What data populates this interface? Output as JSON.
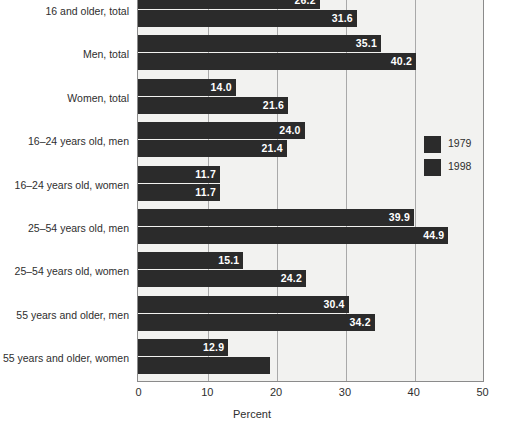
{
  "chart_data": {
    "type": "bar",
    "orientation": "horizontal",
    "title": "",
    "xlabel": "Percent",
    "ylabel": "",
    "xlim": [
      0,
      50
    ],
    "xticks": [
      0,
      10,
      20,
      30,
      40,
      50
    ],
    "grid": true,
    "legend_position": "right",
    "categories": [
      "16 and older, total",
      "Men, total",
      "Women, total",
      "16–24 years old, men",
      "16–24 years old, women",
      "25–54 years old, men",
      "25–54 years old, women",
      "55 years and older, men",
      "55 years and older, women"
    ],
    "series": [
      {
        "name": "1979",
        "values": [
          26.2,
          35.1,
          14.0,
          24.0,
          11.7,
          39.9,
          15.1,
          30.4,
          12.9
        ],
        "labels": [
          "26.2",
          "35.1",
          "14.0",
          "24.0",
          "11.7",
          "39.9",
          "15.1",
          "30.4",
          "12.9"
        ],
        "color": "#2b2b2b"
      },
      {
        "name": "1998",
        "values": [
          31.6,
          40.2,
          21.6,
          21.4,
          11.7,
          44.9,
          24.2,
          34.2,
          18.9
        ],
        "labels": [
          "31.6",
          "40.2",
          "21.6",
          "21.4",
          "11.7",
          "44.9",
          "24.2",
          "34.2",
          ""
        ],
        "color": "#2b2b2b"
      }
    ]
  },
  "legend": {
    "items": [
      {
        "label": "1979"
      },
      {
        "label": "1998"
      }
    ]
  },
  "axis": {
    "tick_labels": [
      "0",
      "10",
      "20",
      "30",
      "40",
      "50"
    ],
    "x_title": "Percent"
  },
  "colors": {
    "bar": "#2b2b2b",
    "plot_background": "#f2f2f0",
    "gridline": "#a9a9a9",
    "axis": "#8b8b8b",
    "text": "#2e2e2e",
    "bar_label": "#ffffff"
  }
}
